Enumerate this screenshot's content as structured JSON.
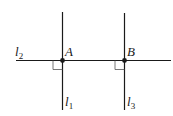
{
  "diagram": {
    "lines": [
      {
        "id": "l1",
        "label": "l",
        "subscript": "1",
        "orientation": "vertical"
      },
      {
        "id": "l2",
        "label": "l",
        "subscript": "2",
        "orientation": "horizontal"
      },
      {
        "id": "l3",
        "label": "l",
        "subscript": "3",
        "orientation": "vertical"
      }
    ],
    "points": [
      {
        "id": "A",
        "label": "A",
        "on": [
          "l1",
          "l2"
        ]
      },
      {
        "id": "B",
        "label": "B",
        "on": [
          "l2",
          "l3"
        ]
      }
    ],
    "relations": [
      "l1 ⊥ l2 at A",
      "l3 ⊥ l2 at B"
    ],
    "colors": {
      "stroke": "#1a1a1a",
      "right_angle": "#555555"
    }
  }
}
